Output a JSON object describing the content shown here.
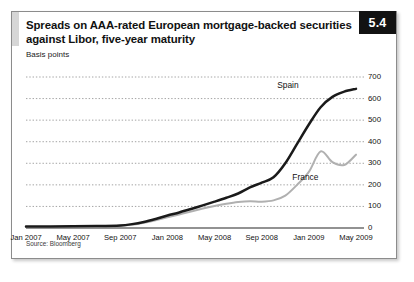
{
  "figure": {
    "number": "5.4",
    "title": "Spreads on AAA-rated European mortgage-backed securities against Libor, five-year maturity",
    "subtitle": "Basis points",
    "source": "Source: Bloomberg"
  },
  "colors": {
    "spain_line": "#1a1a1a",
    "france_line": "#b0b0b0",
    "gridline": "#9a9a9a",
    "axis": "#6e6e6e",
    "badge_bg": "#121212",
    "badge_text": "#ffffff",
    "frame_border": "#8c8c8c",
    "accent_bar": "#d6d6d6"
  },
  "chart_data": {
    "type": "line",
    "title": "Spreads on AAA-rated European mortgage-backed securities against Libor, five-year maturity",
    "xlabel": "",
    "ylabel": "Basis points",
    "ylim": [
      0,
      700
    ],
    "yticks": [
      0,
      100,
      200,
      300,
      400,
      500,
      600,
      700
    ],
    "ytick_labels": [
      "0",
      "100",
      "200",
      "300",
      "400",
      "500",
      "600",
      "700"
    ],
    "y_axis_side": "right",
    "grid": true,
    "grid_style": "dotted-horizontal",
    "xticks": [
      "Jan 2007",
      "May 2007",
      "Sep 2007",
      "Jan 2008",
      "May 2008",
      "Sep 2008",
      "Jan 2009",
      "May 2009"
    ],
    "x_range": [
      "Jan 2007",
      "May 2009"
    ],
    "x_months_total": 28,
    "legend_position": "inline-annotations",
    "series": [
      {
        "name": "Spain",
        "color": "#1a1a1a",
        "label_x_month": 24.2,
        "label_y_value": 660,
        "x_months": [
          0,
          2,
          4,
          6,
          8,
          9,
          10,
          11,
          12,
          13,
          14,
          15,
          16,
          17,
          18,
          19,
          20,
          21,
          22,
          23,
          24,
          25,
          26,
          27,
          28
        ],
        "values": [
          7,
          7,
          8,
          9,
          12,
          18,
          28,
          42,
          58,
          72,
          88,
          105,
          122,
          140,
          160,
          188,
          210,
          235,
          300,
          390,
          480,
          560,
          608,
          632,
          645
        ]
      },
      {
        "name": "France",
        "color": "#b0b0b0",
        "label_x_month": 22.6,
        "label_y_value": 232,
        "x_months": [
          0,
          2,
          4,
          6,
          8,
          9,
          10,
          11,
          12,
          13,
          14,
          15,
          16,
          17,
          18,
          19,
          20,
          21,
          22,
          23,
          24,
          25,
          26,
          27,
          28
        ],
        "values": [
          5,
          5,
          6,
          7,
          10,
          15,
          24,
          36,
          50,
          63,
          76,
          90,
          102,
          112,
          120,
          124,
          122,
          128,
          150,
          200,
          260,
          355,
          305,
          292,
          340
        ]
      }
    ],
    "annotations": [
      {
        "text": "Spain",
        "series": "Spain"
      },
      {
        "text": "France",
        "series": "France"
      }
    ]
  }
}
